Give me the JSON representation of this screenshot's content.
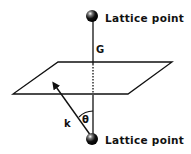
{
  "diagram": {
    "top_point_label": "Lattice point",
    "bottom_point_label": "Lattice point",
    "vector_G_label": "G",
    "vector_k_label": "k",
    "angle_label": "θ",
    "colors": {
      "ink": "#111111",
      "background": "#ffffff"
    }
  }
}
